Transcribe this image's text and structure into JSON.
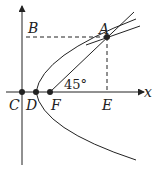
{
  "diagram": {
    "type": "parabola-focus-geometry",
    "labels": {
      "A": "A",
      "B": "B",
      "C": "C",
      "D": "D",
      "E": "E",
      "F": "F",
      "x_axis": "x",
      "angle": "45°"
    },
    "colors": {
      "stroke": "#222222",
      "background": "#ffffff"
    }
  }
}
